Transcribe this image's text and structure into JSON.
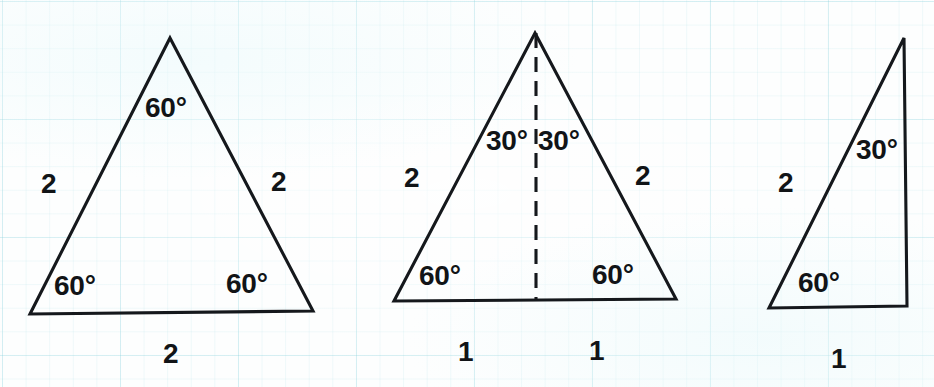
{
  "figure": {
    "stroke_color": "#15181c",
    "grid_color": "#96d7e1",
    "background_color": "#fdfefe",
    "degree_symbol": "°"
  },
  "triangles": [
    {
      "name": "equilateral-triangle",
      "kind": "equilateral",
      "vertices": {
        "apex": [
          170,
          38
        ],
        "base_left": [
          30,
          314
        ],
        "base_right": [
          313,
          311
        ]
      },
      "angles": [
        {
          "id": "apex-angle",
          "value": "60°",
          "position": [
            145,
            94
          ]
        },
        {
          "id": "base-left-angle",
          "value": "60°",
          "position": [
            54,
            272
          ]
        },
        {
          "id": "base-right-angle",
          "value": "60°",
          "position": [
            226,
            270
          ]
        }
      ],
      "sides": [
        {
          "id": "left-side-length",
          "value": "2",
          "position": [
            41,
            170
          ]
        },
        {
          "id": "right-side-length",
          "value": "2",
          "position": [
            271,
            168
          ]
        },
        {
          "id": "base-length",
          "value": "2",
          "position": [
            163,
            340
          ]
        }
      ],
      "dashed_altitude": null
    },
    {
      "name": "bisected-equilateral-triangle",
      "kind": "equilateral-with-altitude",
      "vertices": {
        "apex": [
          535,
          33
        ],
        "base_left": [
          394,
          301
        ],
        "base_right": [
          676,
          299
        ]
      },
      "angles": [
        {
          "id": "apex-left-angle",
          "value": "30°",
          "position": [
            486,
            127
          ]
        },
        {
          "id": "apex-right-angle",
          "value": "30°",
          "position": [
            538,
            127
          ]
        },
        {
          "id": "base-left-angle",
          "value": "60°",
          "position": [
            419,
            262
          ]
        },
        {
          "id": "base-right-angle",
          "value": "60°",
          "position": [
            592,
            261
          ]
        }
      ],
      "sides": [
        {
          "id": "left-side-length",
          "value": "2",
          "position": [
            404,
            164
          ]
        },
        {
          "id": "right-side-length",
          "value": "2",
          "position": [
            635,
            162
          ]
        },
        {
          "id": "base-left-half-length",
          "value": "1",
          "position": [
            458,
            338
          ]
        },
        {
          "id": "base-right-half-length",
          "value": "1",
          "position": [
            589,
            337
          ]
        }
      ],
      "dashed_altitude": {
        "id": "altitude-dashed-line",
        "from": [
          535,
          33
        ],
        "to": [
          536,
          300
        ]
      }
    },
    {
      "name": "right-triangle-30-60-90",
      "kind": "right",
      "vertices": {
        "apex": [
          904,
          38
        ],
        "base_left": [
          769,
          308
        ],
        "base_right": [
          907,
          306
        ]
      },
      "angles": [
        {
          "id": "apex-angle",
          "value": "30°",
          "position": [
            856,
            136
          ]
        },
        {
          "id": "base-left-angle",
          "value": "60°",
          "position": [
            798,
            269
          ]
        }
      ],
      "sides": [
        {
          "id": "hypotenuse-length",
          "value": "2",
          "position": [
            778,
            169
          ]
        },
        {
          "id": "base-length",
          "value": "1",
          "position": [
            831,
            345
          ]
        }
      ],
      "dashed_altitude": null
    }
  ]
}
